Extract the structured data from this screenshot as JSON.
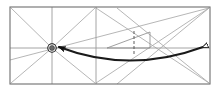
{
  "figure": {
    "background_color": "#ffffff",
    "width": 219,
    "height": 94
  },
  "colors": {
    "frame": "#6e6e6e",
    "grid": "#9a9a9a",
    "diagonal": "#a8a8a8",
    "thin_construction": "#8f8f8f",
    "arrow": "#1a1a1a",
    "marker_fill": "#6a6a6a",
    "marker_stroke": "#111111",
    "dashed": "#555555"
  },
  "frame": {
    "name": "outer-rectangle",
    "x": 10,
    "y": 7,
    "width": 200,
    "height": 77,
    "stroke_width": 1
  },
  "grid_lines": [
    {
      "name": "horizontal-midline",
      "x1": 10,
      "y1": 48,
      "x2": 210,
      "y2": 48
    },
    {
      "name": "vertical-line-left",
      "x1": 52,
      "y1": 7,
      "x2": 52,
      "y2": 84
    },
    {
      "name": "vertical-line-center",
      "x1": 96,
      "y1": 7,
      "x2": 96,
      "y2": 84
    }
  ],
  "diagonals": [
    {
      "name": "diagonal-topleft-to-center",
      "x1": 11,
      "y1": 8,
      "x2": 52,
      "y2": 48
    },
    {
      "name": "diagonal-bottomleft-to-center",
      "x1": 11,
      "y1": 83,
      "x2": 52,
      "y2": 48
    },
    {
      "name": "diagonal-center-to-topright-of-cell",
      "x1": 52,
      "y1": 48,
      "x2": 95,
      "y2": 8
    },
    {
      "name": "diagonal-center-to-bottomright-of-cell",
      "x1": 52,
      "y1": 48,
      "x2": 95,
      "y2": 83
    },
    {
      "name": "diagonal-midleft-to-bottomright",
      "x1": 96,
      "y1": 8,
      "x2": 209,
      "y2": 83
    },
    {
      "name": "diagonal-midleft-bottom-to-topright",
      "x1": 96,
      "y1": 83,
      "x2": 209,
      "y2": 8
    },
    {
      "name": "diagonal-topright-long-to-left",
      "x1": 209,
      "y1": 8,
      "x2": 117,
      "y2": 84
    },
    {
      "name": "diagonal-bottomright-long-to-left",
      "x1": 209,
      "y1": 83,
      "x2": 117,
      "y2": 8
    },
    {
      "name": "diagonal-lower-left-shallow",
      "x1": 10,
      "y1": 60,
      "x2": 209,
      "y2": 8
    }
  ],
  "triangle": {
    "name": "construction-triangle",
    "apex_x": 107,
    "apex_y": 48,
    "top_x": 150,
    "top_y": 32,
    "bottom_x": 150,
    "bottom_y": 48
  },
  "dashed_line": {
    "name": "dashed-vertical-marker",
    "x": 134,
    "y1": 31,
    "y2": 56,
    "dash_pattern": "3,2"
  },
  "curved_arrow": {
    "name": "curved-double-headed-arrow",
    "start_x": 207,
    "start_y": 47,
    "end_x": 56,
    "end_y": 47,
    "control_x": 130,
    "control_y": 74,
    "stroke_width": 1.8,
    "arrowhead_left": "filled-triangle",
    "arrowhead_right": "open-triangle"
  },
  "marker": {
    "name": "origin-node-marker",
    "cx": 52,
    "cy": 48,
    "outer_radius": 4.2,
    "inner_radius": 2.4
  }
}
